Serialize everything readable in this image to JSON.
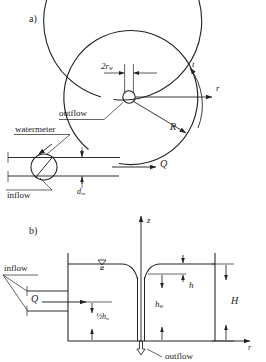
{
  "figure": {
    "type": "engineering-schematic",
    "line_color": "#222222",
    "background": "#ffffff"
  },
  "panel_a": {
    "tag": "a)",
    "view": "plan",
    "labels": {
      "well_diameter": "2r",
      "well_diameter_sub": "w",
      "outflow": "outflow",
      "radius": "R",
      "tangential_axis": "t",
      "radial_axis": "r",
      "watermeter": "watermeter",
      "inflow": "inflow",
      "discharge": "Q",
      "inlet_diameter": "d",
      "inlet_diameter_sub": "in"
    }
  },
  "panel_b": {
    "tag": "b)",
    "view": "cross-section",
    "labels": {
      "inflow": "inflow",
      "discharge": "Q",
      "half_hw": "½h",
      "half_hw_sub": "w",
      "hw": "h",
      "hw_sub": "w",
      "h": "h",
      "H": "H",
      "outflow": "outflow",
      "z_axis": "z",
      "r_axis": "r",
      "water_level_symbol": "water-table-triangle"
    }
  }
}
